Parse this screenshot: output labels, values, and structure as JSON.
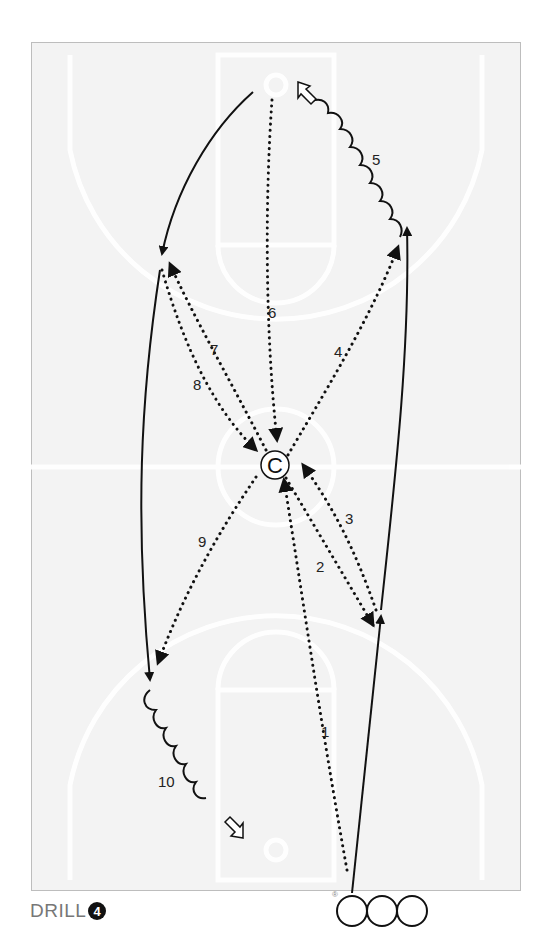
{
  "title": "DRILL",
  "drill_number": "4",
  "coach_label": "C",
  "registered_mark": "®",
  "players_in_line": 3,
  "path_labels": {
    "p1": "1",
    "p2": "2",
    "p3": "3",
    "p4": "4",
    "p5": "5",
    "p6": "6",
    "p7": "7",
    "p8": "8",
    "p9": "9",
    "p10": "10"
  },
  "legend": {
    "dotted": "pass",
    "solid": "cut",
    "wavy": "dribble",
    "hollow_arrow": "shot"
  },
  "colors": {
    "ink": "#111111",
    "court_bg": "#f3f3f3",
    "court_lines": "#ffffff",
    "frame": "#bdbdbd",
    "title": "#777777"
  }
}
